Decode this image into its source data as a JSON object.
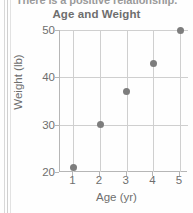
{
  "page": {
    "clipped_sentence": "There is a positive relationship."
  },
  "chart_data": {
    "type": "scatter",
    "title": "Age and Weight",
    "xlabel": "Age (yr)",
    "ylabel": "Weight (lb)",
    "x": [
      1,
      2,
      3,
      4,
      5
    ],
    "values": [
      21,
      30,
      37,
      43,
      50
    ],
    "points": [
      {
        "x": 1,
        "y": 21
      },
      {
        "x": 2,
        "y": 30
      },
      {
        "x": 3,
        "y": 37
      },
      {
        "x": 4,
        "y": 43
      },
      {
        "x": 5,
        "y": 50
      }
    ],
    "xlim": [
      0.5,
      5.3
    ],
    "ylim": [
      20,
      50
    ],
    "xticks": [
      "1",
      "2",
      "3",
      "4",
      "5"
    ],
    "yticks": [
      "20",
      "30",
      "40",
      "50"
    ],
    "ytick_values": [
      20,
      30,
      40,
      50
    ],
    "xtick_values": [
      1,
      2,
      3,
      4,
      5
    ],
    "grid": true,
    "legend": null,
    "colors": {
      "point": "#7d7d7d",
      "grid": "#cfcfcf",
      "axis": "#b6b6b6",
      "text": "#6e6e6e"
    }
  }
}
